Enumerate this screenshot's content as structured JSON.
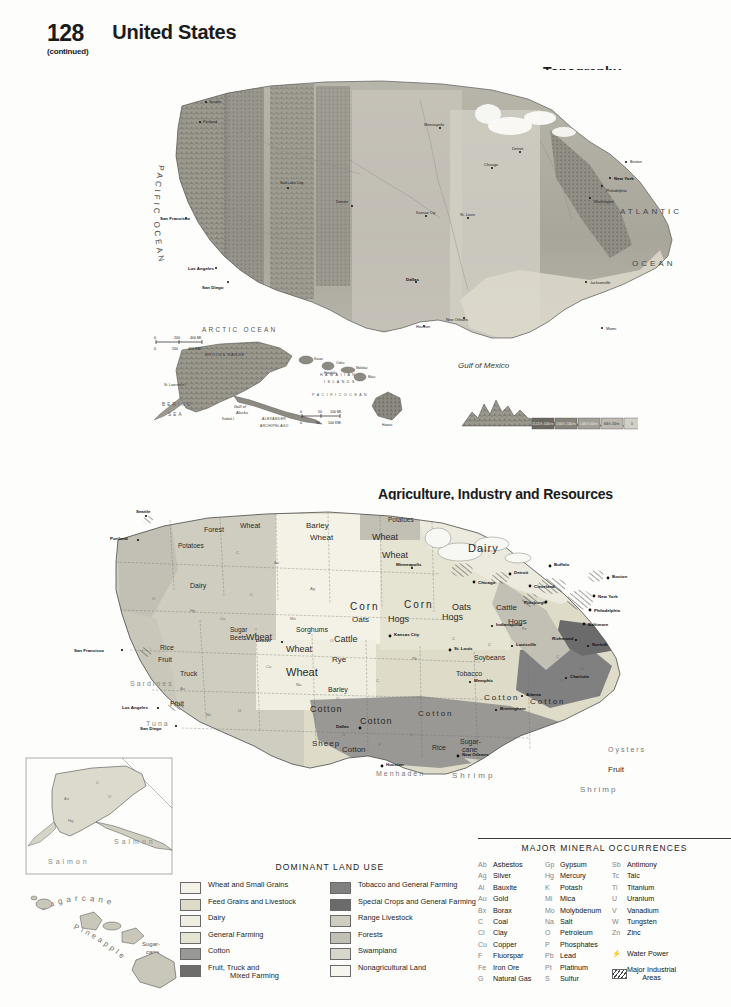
{
  "header": {
    "page_number": "128",
    "continued": "(continued)",
    "title": "United States"
  },
  "maps": [
    {
      "id": "topography",
      "title": "Topography",
      "scale": {
        "miles": {
          "ticks": [
            "0",
            "200",
            "400 MI."
          ]
        },
        "km": {
          "ticks": [
            "0",
            "200",
            "400 KM."
          ]
        }
      },
      "ocean_labels": [
        "PACIFIC OCEAN",
        "ATLANTIC OCEAN",
        "Gulf of Mexico"
      ],
      "insets": [
        {
          "name": "alaska",
          "labels": [
            "ARCTIC OCEAN",
            "BERING SEA",
            "Gulf of Alaska",
            "ALEXANDER ARCHIPELAGO",
            "St. Lawrence I.",
            "Kodiak I.",
            "BROOKS RANGE"
          ],
          "scale": [
            "0",
            "200",
            "400 MI.",
            "0",
            "200",
            "400 KM."
          ]
        },
        {
          "name": "hawaii",
          "labels": [
            "HAWAIIAN ISLANDS",
            "PACIFIC OCEAN",
            "Kauai",
            "Oahu",
            "Molokai",
            "Maui",
            "Hawaii",
            "Honolulu"
          ],
          "scale": [
            "0",
            "50",
            "100 MI.",
            "0",
            "50",
            "100 KM."
          ]
        }
      ],
      "cities": [
        "Seattle",
        "Portland",
        "San Francisco",
        "Los Angeles",
        "San Diego",
        "Salt Lake City",
        "Denver",
        "Dallas",
        "Houston",
        "New Orleans",
        "Kansas City",
        "St. Louis",
        "Chicago",
        "Detroit",
        "Minneapolis",
        "New York",
        "Boston",
        "Philadelphia",
        "Washington",
        "Jacksonville",
        "Miami"
      ],
      "elevation_legend": [
        "13,120 ft. 4,000 m.",
        "6,560 ft. 2,000 m.",
        "1,640 ft. 500 m.",
        "656 ft. 200 m.",
        "0",
        "Sea Level",
        "Below"
      ]
    },
    {
      "id": "agriculture",
      "title": "Agriculture, Industry and Resources",
      "crop_labels": [
        "Wheat",
        "Corn",
        "Oats",
        "Hogs",
        "Cattle",
        "Dairy",
        "Cotton",
        "Sheep",
        "Rice",
        "Barley",
        "Rye",
        "Sorghums",
        "Soybeans",
        "Tobacco",
        "Sugar Beets",
        "Sugar-cane",
        "Fruit",
        "Truck",
        "Potatoes",
        "Forest Products",
        "Salmon",
        "Tuna",
        "Sardines",
        "Shrimp",
        "Oysters",
        "Menhaden",
        "Sugarcane",
        "Pineapple",
        "Flax",
        "Peanuts"
      ],
      "cities": [
        "Seattle",
        "Portland",
        "San Francisco",
        "Los Angeles",
        "San Diego",
        "Denver",
        "Minneapolis",
        "Chicago",
        "Detroit",
        "Cleveland",
        "Buffalo",
        "Pittsburgh",
        "New York",
        "Philadelphia",
        "Baltimore",
        "Boston",
        "Kansas City",
        "St. Louis",
        "Indianapolis",
        "Louisville",
        "Memphis",
        "Atlanta",
        "Birmingham",
        "Charlotte",
        "Norfolk",
        "Richmond",
        "Dallas",
        "Houston",
        "New Orleans"
      ],
      "insets": [
        {
          "name": "alaska",
          "labels": [
            "Salmon"
          ]
        },
        {
          "name": "hawaii",
          "labels": [
            "Sugarcane",
            "Pineapple",
            "Sugar-cane"
          ]
        }
      ]
    }
  ],
  "land_use_legend": {
    "title": "DOMINANT LAND USE",
    "column1": [
      {
        "label": "Wheat and Small Grains",
        "color": "#f4f2e6"
      },
      {
        "label": "Feed Grains and Livestock",
        "color": "#dedcc8"
      },
      {
        "label": "Dairy",
        "color": "#efeee0"
      },
      {
        "label": "General Farming",
        "color": "#e5e3d2"
      },
      {
        "label": "Cotton",
        "color": "#9a9894"
      },
      {
        "label": "Fruit, Truck and",
        "label2": "Mixed Farming",
        "color": "#6f6d6b"
      }
    ],
    "column2": [
      {
        "label": "Tobacco and General Farming",
        "color": "#808080"
      },
      {
        "label": "Special Crops and General Farming",
        "color": "#6b6b6b"
      },
      {
        "label": "Range Livestock",
        "color": "#cfcdc0"
      },
      {
        "label": "Forests",
        "color": "#c2c0b4"
      },
      {
        "label": "Swampland",
        "color": "#d8d6ca"
      },
      {
        "label": "Nonagricultural Land",
        "color": "#f7f6ee"
      }
    ]
  },
  "mineral_legend": {
    "title": "MAJOR MINERAL OCCURRENCES",
    "column1": [
      {
        "symbol": "Ab",
        "name": "Asbestos"
      },
      {
        "symbol": "Ag",
        "name": "Silver"
      },
      {
        "symbol": "Al",
        "name": "Bauxite"
      },
      {
        "symbol": "Au",
        "name": "Gold"
      },
      {
        "symbol": "Bx",
        "name": "Borax"
      },
      {
        "symbol": "C",
        "name": "Coal"
      },
      {
        "symbol": "Cl",
        "name": "Clay"
      },
      {
        "symbol": "Cu",
        "name": "Copper"
      },
      {
        "symbol": "F",
        "name": "Fluorspar"
      },
      {
        "symbol": "Fe",
        "name": "Iron Ore"
      },
      {
        "symbol": "G",
        "name": "Natural Gas"
      }
    ],
    "column2": [
      {
        "symbol": "Gp",
        "name": "Gypsum"
      },
      {
        "symbol": "Hg",
        "name": "Mercury"
      },
      {
        "symbol": "K",
        "name": "Potash"
      },
      {
        "symbol": "Mi",
        "name": "Mica"
      },
      {
        "symbol": "Mo",
        "name": "Molybdenum"
      },
      {
        "symbol": "Na",
        "name": "Salt"
      },
      {
        "symbol": "O",
        "name": "Petroleum"
      },
      {
        "symbol": "P",
        "name": "Phosphates"
      },
      {
        "symbol": "Pb",
        "name": "Lead"
      },
      {
        "symbol": "Pt",
        "name": "Platinum"
      },
      {
        "symbol": "S",
        "name": "Sulfur"
      }
    ],
    "column3": [
      {
        "symbol": "Sb",
        "name": "Antimony"
      },
      {
        "symbol": "Tc",
        "name": "Talc"
      },
      {
        "symbol": "Ti",
        "name": "Titanium"
      },
      {
        "symbol": "U",
        "name": "Uranium"
      },
      {
        "symbol": "V",
        "name": "Vanadium"
      },
      {
        "symbol": "W",
        "name": "Tungsten"
      },
      {
        "symbol": "Zn",
        "name": "Zinc"
      }
    ],
    "extras": [
      {
        "symbol": "⚡",
        "name": "Water Power"
      },
      {
        "symbol": "hatch",
        "name": "Major Industrial",
        "name2": "Areas"
      }
    ]
  }
}
